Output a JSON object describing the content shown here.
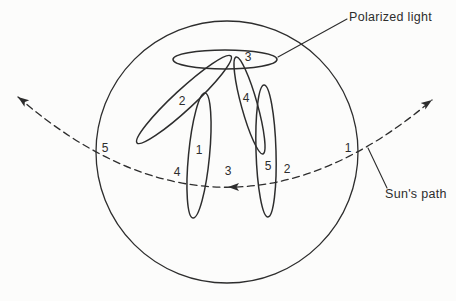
{
  "colors": {
    "ink": "#2d2d2d",
    "paper": "#fcfcfb"
  },
  "annotations": {
    "polarized_light": "Polarized light",
    "suns_path": "Sun's path"
  },
  "ellipse_numbers": {
    "n1": "1",
    "n2": "2",
    "n3": "3",
    "n4": "4",
    "n5": "5"
  },
  "sun_path_numbers": {
    "n1": "1",
    "n2": "2",
    "n3": "3",
    "n4": "4",
    "n5": "5"
  }
}
